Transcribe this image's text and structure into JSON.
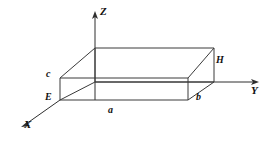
{
  "figure": {
    "caption": "Rectangular box in an X-Y-Z coordinate system",
    "stroke_color": "#3a3a3a",
    "background_color": "#ffffff",
    "axes": [
      {
        "id": "x",
        "label": "X",
        "label_x": 24,
        "label_y": 120
      },
      {
        "id": "y",
        "label": "Y",
        "label_x": 250,
        "label_y": 86
      },
      {
        "id": "z",
        "label": "Z",
        "label_x": 100,
        "label_y": 8
      }
    ],
    "dimensions": [
      {
        "id": "a",
        "label": "a",
        "label_x": 108,
        "label_y": 108
      },
      {
        "id": "b",
        "label": "b",
        "label_x": 196,
        "label_y": 95
      },
      {
        "id": "c",
        "label": "c",
        "label_x": 46,
        "label_y": 70
      }
    ],
    "vertices": [
      {
        "id": "E",
        "label": "E",
        "label_x": 45,
        "label_y": 93
      },
      {
        "id": "H",
        "label": "H",
        "label_x": 216,
        "label_y": 57
      }
    ]
  },
  "geometry": {
    "origin": {
      "x": 95,
      "y": 100
    },
    "z_axis_top": {
      "x": 95,
      "y": 14
    },
    "y_axis_end": {
      "x": 258,
      "y": 82
    },
    "x_axis_end": {
      "x": 22,
      "y": 126
    },
    "front_bottom_left": {
      "x": 60,
      "y": 100
    },
    "front_bottom_right": {
      "x": 188,
      "y": 100
    },
    "front_top_left": {
      "x": 60,
      "y": 78
    },
    "front_top_right": {
      "x": 188,
      "y": 78
    },
    "back_bottom_left": {
      "x": 95,
      "y": 82
    },
    "back_bottom_right": {
      "x": 214,
      "y": 82
    },
    "back_top_left": {
      "x": 95,
      "y": 48
    },
    "back_top_right": {
      "x": 214,
      "y": 48
    }
  }
}
